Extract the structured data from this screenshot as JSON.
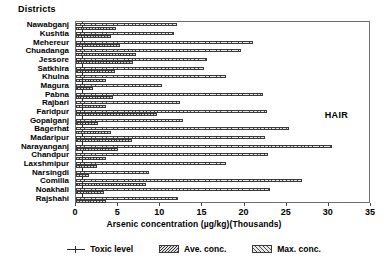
{
  "axis_title_y": "Districts",
  "annotation": "HAIR",
  "xlabel": "Arsenic concentration (µg/kg)(Thousands)",
  "legend": {
    "toxic": "Toxic level",
    "ave": "Ave. conc.",
    "max": "Max. conc."
  },
  "chart_data": {
    "type": "bar",
    "orientation": "horizontal",
    "title": "",
    "subtitle": "HAIR",
    "xlabel": "Arsenic concentration (µg/kg)(Thousands)",
    "ylabel": "Districts",
    "xlim": [
      0,
      35
    ],
    "xticks": [
      0,
      5,
      10,
      15,
      20,
      25,
      30,
      35
    ],
    "grid": false,
    "legend_position": "bottom-center",
    "toxic_level": 0.75,
    "categories": [
      "Nawabganj",
      "Kushtia",
      "Mehereur",
      "Chuadanga",
      "Jessore",
      "Satkhira",
      "Khulna",
      "Magura",
      "Pabna",
      "Rajbari",
      "Faridpur",
      "Gopalganj",
      "Bagerhat",
      "Madaripur",
      "Narayanganj",
      "Chandpur",
      "Laxshmipur",
      "Narsingdi",
      "Comilla",
      "Noakhali",
      "Rajshahi"
    ],
    "series": [
      {
        "name": "Max. conc.",
        "values": [
          12.0,
          11.6,
          21.0,
          19.6,
          15.5,
          15.2,
          17.8,
          10.2,
          22.2,
          12.3,
          22.7,
          12.7,
          25.3,
          22.4,
          30.4,
          22.8,
          17.8,
          8.7,
          26.8,
          23.0,
          12.1
        ]
      },
      {
        "name": "Ave. conc.",
        "values": [
          4.7,
          4.2,
          5.2,
          7.1,
          6.8,
          4.6,
          3.6,
          2.0,
          4.4,
          3.6,
          9.6,
          2.6,
          4.1,
          6.6,
          5.0,
          3.5,
          2.5,
          1.6,
          8.3,
          3.3,
          3.5
        ]
      }
    ]
  }
}
